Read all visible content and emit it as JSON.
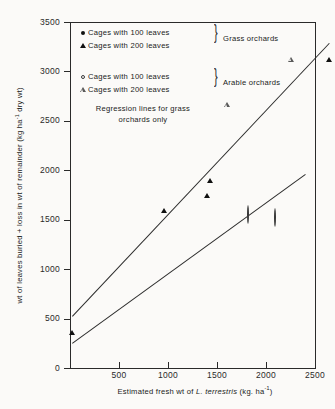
{
  "chart_data": {
    "type": "scatter",
    "title": "",
    "xlabel": "Estimated fresh wt of L. terrestris (kg. ha-1)",
    "ylabel": "wt of leaves buried + loss in wt of remainder (kg ha-1 dry wt)",
    "xlim": [
      0,
      2500
    ],
    "ylim": [
      0,
      3500
    ],
    "xticks": [
      500,
      1000,
      1500,
      2000,
      2500
    ],
    "yticks": [
      0,
      500,
      1000,
      1500,
      2000,
      2500,
      3000,
      3500
    ],
    "grid": false,
    "legend_position": "upper-left-inside",
    "series": [
      {
        "name": "Cages with 100 leaves",
        "group": "Grass orchards",
        "marker": "filled-circle",
        "points": [
          [
            20,
            250
          ],
          [
            580,
            830
          ],
          [
            1190,
            890
          ],
          [
            1410,
            1060
          ],
          [
            1880,
            1740
          ]
        ]
      },
      {
        "name": "Cages with 200 leaves",
        "group": "Grass orchards",
        "marker": "filled-triangle",
        "points": [
          [
            20,
            530
          ],
          [
            960,
            1760
          ],
          [
            1400,
            1910
          ],
          [
            1430,
            2060
          ],
          [
            2640,
            3290
          ]
        ]
      },
      {
        "name": "Cages with 100 leaves",
        "group": "Arable orchards",
        "marker": "open-circle",
        "points": [
          [
            1830,
            1620
          ],
          [
            2100,
            1590
          ]
        ]
      },
      {
        "name": "Cages with 200 leaves",
        "group": "Arable orchards",
        "marker": "open-triangle",
        "points": [
          [
            1600,
            2660
          ],
          [
            2250,
            3120
          ]
        ]
      }
    ],
    "regression_lines": [
      {
        "name": "grass-100-leaves",
        "from": [
          20,
          250
        ],
        "to": [
          2400,
          1960
        ]
      },
      {
        "name": "grass-200-leaves",
        "from": [
          20,
          530
        ],
        "to": [
          2640,
          3290
        ]
      }
    ],
    "annotations": [
      "Regression lines for grass orchards only"
    ]
  },
  "axes": {
    "xtitle_pre": "Estimated  fresh  wt  of ",
    "xtitle_italic": "L. terrestris",
    "xtitle_post": " (kg. ha",
    "xtitle_sup": "-1",
    "xtitle_end": ")",
    "ytitle": "wt of leaves buried + loss in wt of remainder (kg ha",
    "ytitle_sup": "-1",
    "ytitle_end": " dry wt)",
    "ytick_labels": [
      "3500",
      "3000",
      "2500",
      "2000",
      "1500",
      "1000",
      "500",
      "0"
    ],
    "xtick_labels": [
      "500",
      "1000",
      "1500",
      "2000",
      "2500"
    ]
  },
  "legend": {
    "rows": [
      {
        "label": "Cages  with  100 leaves",
        "marker": "filled-circle"
      },
      {
        "label": "Cages  with  200 leaves",
        "marker": "filled-triangle"
      },
      {
        "label": "Cages  with  100 leaves",
        "marker": "open-circle"
      },
      {
        "label": "Cages  with  200 leaves",
        "marker": "open-triangle"
      }
    ],
    "group_grass": "Grass  orchards",
    "group_arable": "Arable  orchards",
    "note_line1": "Regression lines for grass",
    "note_line2": "orchards  only"
  },
  "colors": {
    "axis": "#2a2a2a",
    "marker_filled": "#111111",
    "marker_open": "#5a5a5a",
    "background": "#fbfaf8"
  }
}
